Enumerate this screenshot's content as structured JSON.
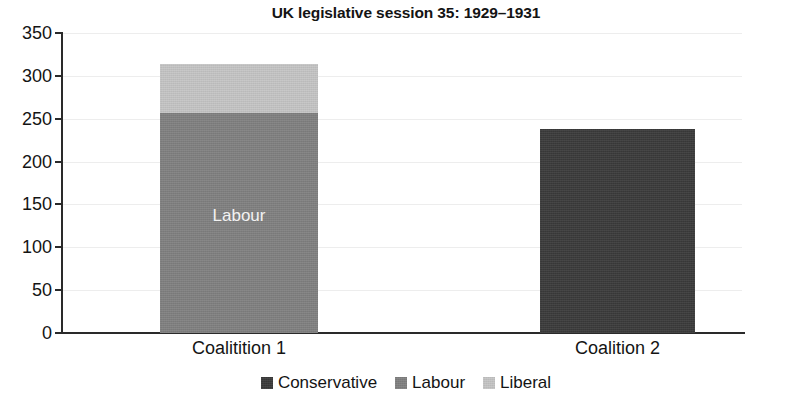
{
  "chart_data": {
    "type": "bar",
    "subtype": "stacked-bar",
    "title": "UK legislative session 35: 1929–1931",
    "xlabel": "",
    "ylabel": "",
    "ylim": [
      0,
      350
    ],
    "yticks": [
      0,
      50,
      100,
      150,
      200,
      250,
      300,
      350
    ],
    "ytick_labels": [
      "0",
      "50",
      "100",
      "150",
      "200",
      "250",
      "300",
      "350"
    ],
    "grid": true,
    "grid_axis": "y",
    "legend_position": "bottom",
    "categories": [
      "Coalitition 1",
      "Coalition 2"
    ],
    "series": [
      {
        "name": "Conservative",
        "color": "#3a3a3a",
        "values": [
          0,
          238
        ]
      },
      {
        "name": "Labour",
        "color": "#808080",
        "values": [
          257,
          0
        ]
      },
      {
        "name": "Liberal",
        "color": "#c4c4c4",
        "values": [
          57,
          0
        ]
      }
    ],
    "totals": [
      314,
      238
    ],
    "annotations": [
      {
        "text": "Labour",
        "category": "Coalitition 1",
        "series": "Labour",
        "color": "#f2f2f2"
      }
    ]
  },
  "legend": {
    "items": [
      {
        "label": "Conservative",
        "color": "#3a3a3a"
      },
      {
        "label": "Labour",
        "color": "#808080"
      },
      {
        "label": "Liberal",
        "color": "#c4c4c4"
      }
    ]
  },
  "axis": {
    "y_labels": [
      "350",
      "300",
      "250",
      "200",
      "150",
      "100",
      "50",
      "0"
    ],
    "x_labels": [
      "Coalitition 1",
      "Coalition 2"
    ]
  }
}
